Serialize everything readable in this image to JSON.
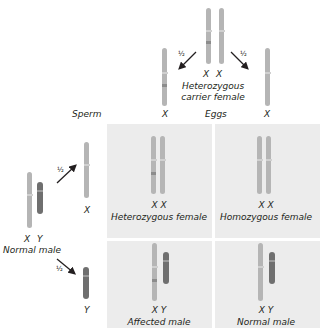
{
  "mother": {
    "genotype": [
      "X",
      "X"
    ],
    "label_line1": "Heterozygous",
    "label_line2": "carrier female"
  },
  "father": {
    "genotype": [
      "X",
      "Y"
    ],
    "label": "Normal male"
  },
  "headers": {
    "sperm": "Sperm",
    "eggs": "Eggs"
  },
  "gametes": {
    "eggs": [
      {
        "label": "X",
        "prob": "½"
      },
      {
        "label": "X",
        "prob": "½"
      }
    ],
    "sperm": [
      {
        "label": "X",
        "prob": "½"
      },
      {
        "label": "Y",
        "prob": "½"
      }
    ]
  },
  "punnett": [
    {
      "genotype": "X  X",
      "label": "Heterozygous female"
    },
    {
      "genotype": "X  X",
      "label": "Homozygous female"
    },
    {
      "genotype": "X  Y",
      "label": "Affected male"
    },
    {
      "genotype": "X  Y",
      "label": "Normal male"
    }
  ],
  "colors": {
    "x_chromosome": "#b5b5b5",
    "y_chromosome": "#6f6f6f",
    "panel": "#ececec",
    "mutant_band": "#8c8c8c"
  }
}
